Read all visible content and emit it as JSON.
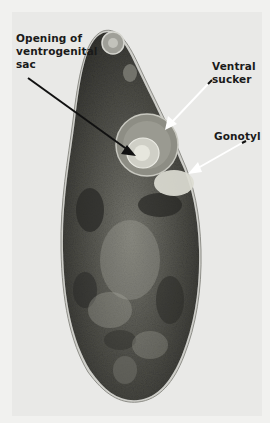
{
  "figure": {
    "labels": [
      {
        "id": "opening",
        "text_lines": [
          "Opening of",
          "ventrogenital",
          "sac"
        ]
      },
      {
        "id": "ventral",
        "text_lines": [
          "Ventral",
          "sucker"
        ]
      },
      {
        "id": "gonotyl",
        "text_lines": [
          "Gonotyl"
        ]
      }
    ],
    "colors": {
      "background": "#f1f1ef",
      "body_dark": "#3a3a36",
      "body_mid": "#5e5e58",
      "body_light": "#9a9a92",
      "arrow_black": "#111111",
      "arrow_white": "#ffffff",
      "label_text": "#1a1a1a"
    }
  }
}
